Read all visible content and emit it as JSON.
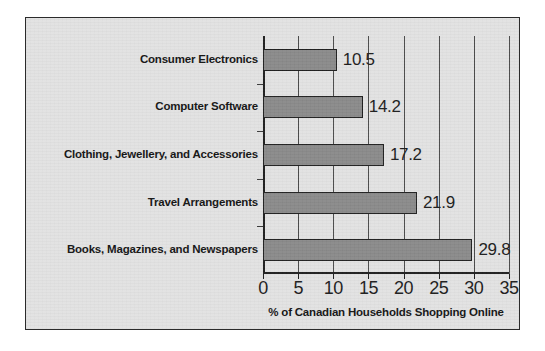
{
  "chart_data": {
    "type": "bar",
    "orientation": "horizontal",
    "title": "",
    "xlabel": "% of Canadian Households Shopping Online",
    "ylabel": "",
    "categories": [
      "Consumer Electronics",
      "Computer Software",
      "Clothing, Jewellery, and Accessories",
      "Travel Arrangements",
      "Books, Magazines, and Newspapers"
    ],
    "values": [
      10.5,
      14.2,
      17.2,
      21.9,
      29.8
    ],
    "value_labels": [
      "10.5",
      "14.2",
      "17.2",
      "21.9",
      "29.8"
    ],
    "xlim": [
      0,
      35
    ],
    "xticks": [
      0,
      5,
      10,
      15,
      20,
      25,
      30,
      35
    ],
    "xticklabels": [
      "0",
      "5",
      "10",
      "15",
      "20",
      "25",
      "30",
      "35"
    ],
    "grid": "vertical",
    "legend": "none",
    "colors": {
      "bar_fill": "#8a8a8a",
      "bar_edge": "#1f1f1f",
      "axis": "#1e1e1e",
      "gridline": "#4a4a4a",
      "background": "#e2e2e2",
      "frame_border": "#2b2b2b",
      "text": "#141414"
    }
  }
}
